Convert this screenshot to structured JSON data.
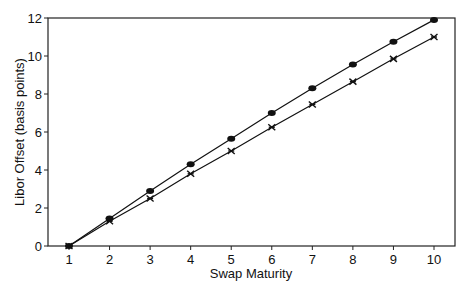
{
  "chart_data": {
    "type": "line",
    "title": "",
    "xlabel": "Swap Maturity",
    "ylabel": "Libor Offset (basis points)",
    "x": [
      1,
      2,
      3,
      4,
      5,
      6,
      7,
      8,
      9,
      10
    ],
    "x_ticks": [
      "1",
      "2",
      "3",
      "4",
      "5",
      "6",
      "7",
      "8",
      "9",
      "10"
    ],
    "y_ticks": [
      "0",
      "2",
      "4",
      "6",
      "8",
      "10",
      "12"
    ],
    "xlim": [
      0.83,
      10.57
    ],
    "ylim": [
      0,
      12
    ],
    "grid": false,
    "legend": null,
    "series": [
      {
        "name": "upper (filled diamond markers)",
        "marker": "diamond",
        "values": [
          0,
          1.45,
          2.9,
          4.3,
          5.65,
          7.0,
          8.3,
          9.55,
          10.75,
          11.9
        ]
      },
      {
        "name": "lower (star markers)",
        "marker": "star",
        "values": [
          0,
          1.3,
          2.5,
          3.8,
          5.0,
          6.25,
          7.45,
          8.65,
          9.85,
          11.0
        ]
      }
    ]
  }
}
